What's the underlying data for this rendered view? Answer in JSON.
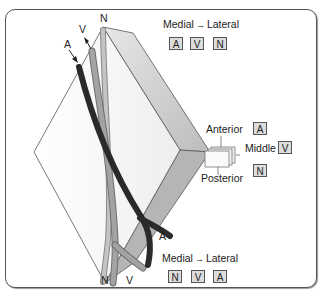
{
  "figure": {
    "structure_labels": {
      "artery_top": "A",
      "vein_top": "V",
      "nerve_top": "N",
      "artery_bottom": "A",
      "vein_bottom": "V",
      "nerve_bottom": "N"
    },
    "top_order": {
      "medial": "Medial",
      "arrow": "→",
      "lateral": "Lateral",
      "items": [
        "A",
        "V",
        "N"
      ]
    },
    "layer_legend": {
      "anterior": "Anterior",
      "middle": "Middle",
      "posterior": "Posterior",
      "anterior_item": "A",
      "middle_item": "V",
      "posterior_item": "N"
    },
    "bottom_order": {
      "medial": "Medial",
      "arrow": "→",
      "lateral": "Lateral",
      "items": [
        "N",
        "V",
        "A"
      ]
    },
    "colors": {
      "artery": "#2e2e2e",
      "vein": "#8a8a8a",
      "nerve": "#b9b9b9",
      "slab_side": "#c8c8c8",
      "label_box": "#dcdcdc"
    }
  }
}
